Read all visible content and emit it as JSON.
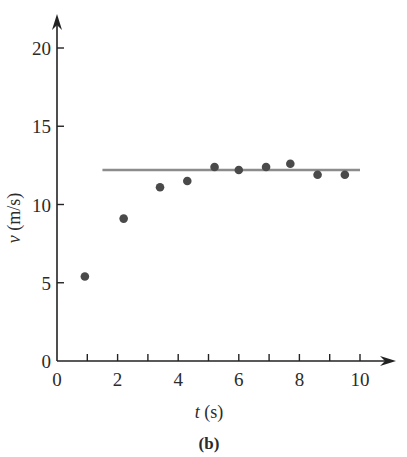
{
  "chart_data": {
    "type": "scatter",
    "title": "",
    "panel_label": "(b)",
    "xlabel_var": "t",
    "xlabel_unit": " (s)",
    "ylabel_var": "v",
    "ylabel_unit": " (m/s)",
    "xlim": [
      0,
      10
    ],
    "ylim": [
      0,
      20
    ],
    "xticks_major": [
      0,
      2,
      4,
      6,
      8,
      10
    ],
    "xticks_minor": [
      1,
      3,
      5,
      7,
      9
    ],
    "yticks": [
      0,
      5,
      10,
      15,
      20
    ],
    "grid": false,
    "points": {
      "x": [
        0.92,
        2.2,
        3.4,
        4.3,
        5.2,
        6.0,
        6.9,
        7.7,
        8.6,
        9.5
      ],
      "y": [
        5.4,
        9.1,
        11.1,
        11.5,
        12.4,
        12.2,
        12.4,
        12.6,
        11.9,
        11.9
      ]
    },
    "reference_line": {
      "y": 12.2,
      "x_start": 1.5,
      "x_end": 10.0
    },
    "colors": {
      "points": "#4a4a4a",
      "line": "#8c8c8c",
      "axis": "#222222"
    }
  }
}
